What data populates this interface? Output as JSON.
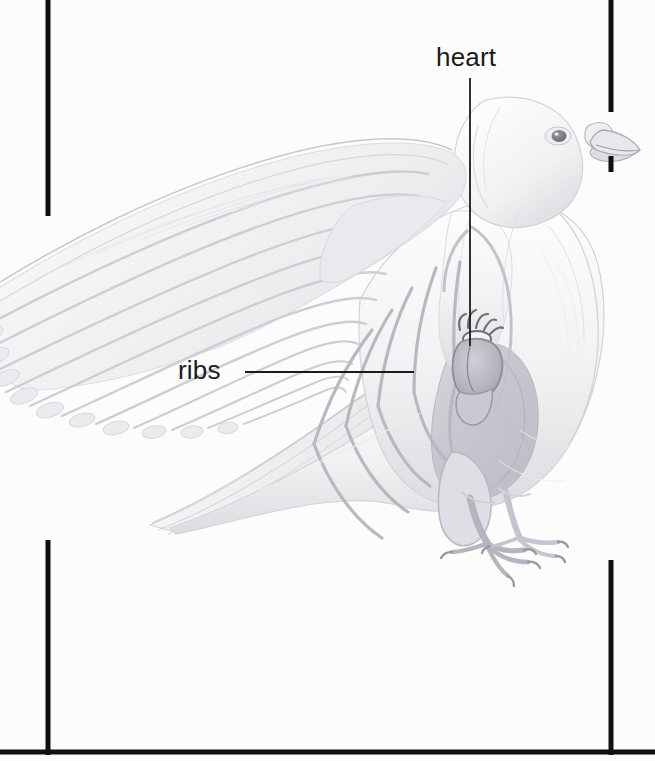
{
  "figure": {
    "medium": "pencil-drawing",
    "background_color": "#fcfcfc",
    "border_color": "#111111"
  },
  "labels": [
    {
      "id": "heart",
      "text": "heart",
      "x": 436,
      "y": 42
    },
    {
      "id": "ribs",
      "text": "ribs",
      "x": 178,
      "y": 355
    }
  ],
  "label_text": {
    "heart": "heart",
    "ribs": "ribs"
  },
  "leader_lines": [
    {
      "id": "heart-leader",
      "orientation": "vertical",
      "x1": 470,
      "y1": 78,
      "x2": 470,
      "y2": 346,
      "color": "#1b1b1b"
    },
    {
      "id": "ribs-leader",
      "orientation": "horizontal",
      "x1": 245,
      "y1": 372,
      "x2": 414,
      "y2": 372,
      "color": "#1b1b1b"
    }
  ],
  "frame": {
    "left_line": {
      "x": 46,
      "y_start": 2,
      "y_end": 216
    },
    "right_line_upper": {
      "x": 611,
      "y_start": 2,
      "y_end": 112
    },
    "right_line_lower": {
      "x": 611,
      "y_start": 158,
      "y_end": 170
    },
    "bottom_left_corner": {
      "x": 46,
      "y": 752
    },
    "bottom_right_corner": {
      "x": 612,
      "y": 752
    },
    "bottom_line": {
      "y": 752,
      "x_start": 0,
      "x_end": 655
    },
    "stroke_width": 5
  },
  "anatomy_parts": [
    "head",
    "eye",
    "beak",
    "cere",
    "neck",
    "breast",
    "wing",
    "primary-feathers",
    "secondary-feathers",
    "tail",
    "legs",
    "feet",
    "claws",
    "heart",
    "ribs",
    "sternum",
    "keel"
  ],
  "colors": {
    "paper": "#fcfcfc",
    "ink": "#1b1b1b",
    "pencil_light": "#e4e4e6",
    "pencil_mid": "#cfcfd4",
    "pencil_dark": "#b4b4bb",
    "breast_shadow": "#c2c2ca",
    "heart_organ": "#a9a9b2"
  }
}
